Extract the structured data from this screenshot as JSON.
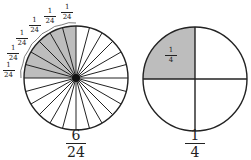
{
  "figures": [
    {
      "id": "left",
      "slices": 24,
      "shaded": 6,
      "label": {
        "numerator": "6",
        "denominator": "24"
      },
      "slice_labels": {
        "numerator": "1",
        "denominator": "24",
        "count": 6
      }
    },
    {
      "id": "right",
      "slices": 4,
      "shaded": 1,
      "label": {
        "numerator": "1",
        "denominator": "4"
      },
      "inner_label": {
        "numerator": "1",
        "denominator": "4"
      }
    }
  ],
  "colors": {
    "shade": "#bdbdbd",
    "stroke": "#222222",
    "background": "#ffffff"
  }
}
